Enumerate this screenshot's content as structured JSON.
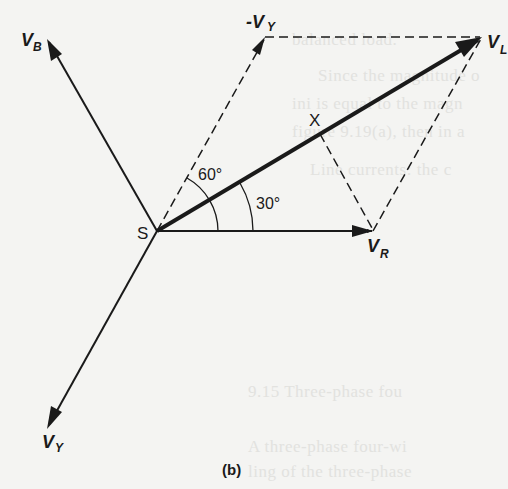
{
  "figure": {
    "caption": "(b)",
    "origin_label": "S",
    "vectors": {
      "V_R": {
        "main": "V",
        "sub": "R"
      },
      "V_B": {
        "main": "V",
        "sub": "B"
      },
      "V_Y": {
        "main": "V",
        "sub": "Y"
      },
      "neg_V_Y": {
        "main": "-V",
        "sub": "Y"
      },
      "V_L": {
        "main": "V",
        "sub": "L"
      }
    },
    "point_x": "X",
    "angles": {
      "inner": "30°",
      "outer": "60°"
    },
    "colors": {
      "ink": "#1a1a1a",
      "paper": "#f4f4f2",
      "show_through": "#e2e2df"
    }
  },
  "show_through_text": [
    "balanced load.",
    "Since the magnitude o",
    "ini is equal to the magn",
    "figure 9.19(a), then in a",
    "Line currents: the c",
    "9.15  Three-phase fou",
    "A three-phase four-wi",
    "ling of the three-phase"
  ]
}
